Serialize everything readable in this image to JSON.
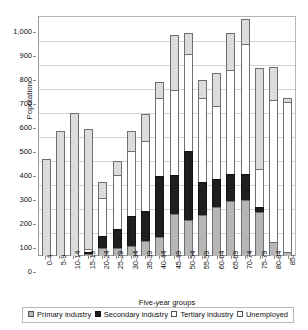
{
  "chart_data": {
    "type": "bar",
    "subtype": "stacked-column",
    "title": "",
    "xlabel": "Five-year groups",
    "ylabel": "Population",
    "ylim": [
      0,
      1000
    ],
    "ytick_step": 100,
    "ytick_labels": [
      "1,000",
      "900",
      "800",
      "700",
      "600",
      "500",
      "400",
      "300",
      "200",
      "100",
      "0"
    ],
    "grid": true,
    "legend_position": "bottom",
    "categories": [
      "0-4",
      "5-9",
      "10-14",
      "15-19",
      "20-24",
      "25-29",
      "30-34",
      "35-39",
      "40-44",
      "45-49",
      "50-54",
      "55-59",
      "60-64",
      "65-69",
      "70-74",
      "75-79",
      "80-84",
      "85-"
    ],
    "series": [
      {
        "name": "Primary industry",
        "color": "#b6b6b6",
        "values": [
          0,
          0,
          0,
          8,
          35,
          32,
          40,
          62,
          80,
          175,
          150,
          172,
          205,
          230,
          235,
          185,
          60,
          18
        ]
      },
      {
        "name": "Secondary industry",
        "color": "#1f1f1f",
        "values": [
          0,
          0,
          0,
          14,
          52,
          85,
          133,
          128,
          258,
          165,
          292,
          140,
          120,
          115,
          110,
          25,
          0,
          0
        ]
      },
      {
        "name": "Tertiary industry",
        "color": "#ffffff",
        "values": [
          0,
          0,
          0,
          15,
          165,
          228,
          275,
          298,
          330,
          360,
          410,
          355,
          310,
          440,
          545,
          160,
          595,
          630
        ]
      },
      {
        "name": "Unemployed",
        "color": "#dcdcdc",
        "values": [
          405,
          520,
          595,
          505,
          68,
          65,
          87,
          115,
          70,
          235,
          90,
          78,
          140,
          155,
          110,
          425,
          140,
          20
        ]
      }
    ],
    "totals": [
      405,
      520,
      595,
      542,
      320,
      410,
      535,
      603,
      738,
      935,
      942,
      745,
      775,
      940,
      1000,
      795,
      795,
      668
    ]
  },
  "legend": {
    "items": [
      {
        "label": "Primary industry",
        "swatch": "primary-swatch"
      },
      {
        "label": "Secondary industry",
        "swatch": "secondary-swatch"
      },
      {
        "label": "Tertiary industry",
        "swatch": "tertiary-swatch"
      },
      {
        "label": "Unemployed",
        "swatch": "unemployed-swatch"
      }
    ]
  }
}
